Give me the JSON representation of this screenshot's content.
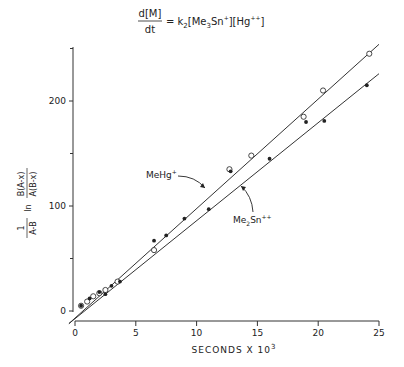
{
  "chart_data": {
    "type": "scatter",
    "title_parts": {
      "lhs_num": "d[M]",
      "lhs_den": "dt",
      "rhs": "= k2[Me3Sn+][Hg++]"
    },
    "xlabel": "SECONDS X 10^3",
    "xlabel_main": "SECONDS X 10",
    "xlabel_exp": "3",
    "ylabel": "1/(A-B) ln B(A-x)/A(B-x)",
    "ylabel_parts": {
      "frac1_num": "1",
      "frac1_den": "A-B",
      "ln": "ln",
      "frac2_num": "B(A-x)",
      "frac2_den": "A(B-x)"
    },
    "xlim": [
      0,
      25
    ],
    "ylim": [
      0,
      250
    ],
    "x_ticks": [
      0,
      5,
      10,
      15,
      20,
      25
    ],
    "y_ticks": [
      0,
      100,
      200
    ],
    "y_minor_ticks": [
      50,
      150,
      250
    ],
    "grid": false,
    "series": [
      {
        "name": "MeHg+",
        "marker": "open-circle",
        "points": [
          [
            0.5,
            5
          ],
          [
            1.0,
            9
          ],
          [
            1.5,
            14
          ],
          [
            2.0,
            17
          ],
          [
            2.5,
            20
          ],
          [
            3.5,
            28
          ],
          [
            6.5,
            58
          ],
          [
            12.7,
            135
          ],
          [
            14.5,
            148
          ],
          [
            18.8,
            185
          ],
          [
            20.4,
            210
          ],
          [
            24.2,
            245
          ]
        ],
        "fit_line": [
          [
            -0.5,
            -12
          ],
          [
            25,
            254
          ]
        ]
      },
      {
        "name": "Me2Sn++",
        "marker": "filled-circle",
        "points": [
          [
            0.5,
            5
          ],
          [
            1.2,
            12
          ],
          [
            2.0,
            18
          ],
          [
            2.5,
            16
          ],
          [
            3.0,
            24
          ],
          [
            3.7,
            28
          ],
          [
            6.5,
            67
          ],
          [
            7.5,
            72
          ],
          [
            9.0,
            88
          ],
          [
            11.0,
            97
          ],
          [
            12.8,
            133
          ],
          [
            16.0,
            145
          ],
          [
            19.0,
            180
          ],
          [
            20.5,
            181
          ],
          [
            24.0,
            215
          ]
        ],
        "fit_line": [
          [
            -0.5,
            -12
          ],
          [
            25,
            226
          ]
        ]
      }
    ],
    "annotations": [
      {
        "text": "MeHg",
        "sup": "+",
        "x": 7.5,
        "y": 140,
        "arrow_to": [
          10.4,
          118
        ]
      },
      {
        "text": "Me2Sn",
        "sup": "++",
        "x": 14.5,
        "y": 78,
        "arrow_to": [
          12.5,
          103
        ]
      }
    ]
  },
  "labels": {
    "tick_x": [
      "0",
      "5",
      "10",
      "15",
      "20",
      "25"
    ],
    "tick_y": [
      "0",
      "100",
      "200"
    ],
    "ann_mehg": "MeHg",
    "ann_mehg_sup": "+",
    "ann_sn_a": "Me",
    "ann_sn_sub": "2",
    "ann_sn_b": "Sn",
    "ann_sn_sup": "++"
  }
}
